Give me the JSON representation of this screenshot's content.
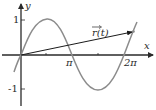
{
  "figure": {
    "axes": {
      "x_label": "x",
      "y_label": "y",
      "y_ticks": [
        {
          "value": 1,
          "label": "1"
        },
        {
          "value": -1,
          "label": "-1"
        }
      ],
      "x_ticks": [
        {
          "value": "π",
          "label": "π"
        },
        {
          "value": "2π",
          "label": "2π"
        }
      ]
    },
    "curve": {
      "description": "sine curve y = sin(x) over approximately [-0.3, 2.35π]",
      "color": "#8c8c8c"
    },
    "vector": {
      "label": "r(t)",
      "label_has_arrow_accent": true,
      "color": "#1a1a1a",
      "from": "origin",
      "to": "point on curve near x ≈ 2.2π"
    },
    "colors": {
      "axis": "#2a2a2a",
      "curve": "#8c8c8c",
      "vector": "#1a1a1a",
      "text": "#2a2a2a"
    }
  }
}
